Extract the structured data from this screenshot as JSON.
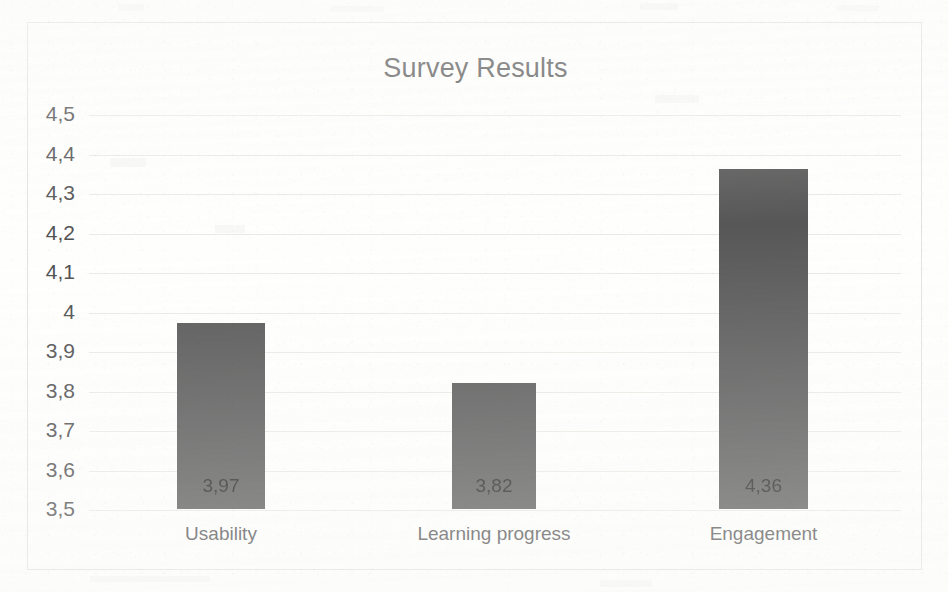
{
  "chart_data": {
    "type": "bar",
    "title": "Survey Results",
    "xlabel": "",
    "ylabel": "",
    "categories": [
      "Usability",
      "Learning progress",
      "Engagement"
    ],
    "values": [
      3.97,
      3.82,
      4.36
    ],
    "value_labels": [
      "3,97",
      "3,82",
      "4,36"
    ],
    "ylim": [
      3.5,
      4.5
    ],
    "ytick_labels": [
      "4,5",
      "4,4",
      "4,3",
      "4,2",
      "4,1",
      "4",
      "3,9",
      "3,8",
      "3,7",
      "3,6",
      "3,5"
    ],
    "ytick_values": [
      4.5,
      4.4,
      4.3,
      4.2,
      4.1,
      4.0,
      3.9,
      3.8,
      3.7,
      3.6,
      3.5
    ],
    "grid": true,
    "legend": false,
    "decimal_separator": ",",
    "bar_color": "#575757",
    "gridline_color": "#e9e9e6",
    "frame_color": "#e2e2e0",
    "title_color": "#59595a",
    "label_color": "#4f4f50",
    "background_color": "#fefefd"
  }
}
